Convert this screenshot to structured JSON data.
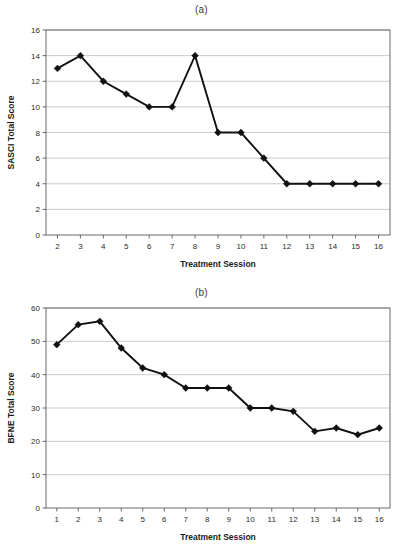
{
  "figure": {
    "panels": [
      {
        "id": "a",
        "title": "(a)",
        "xlabel": "Treatment Session",
        "ylabel": "SASCI Total Score"
      },
      {
        "id": "b",
        "title": "(b)",
        "xlabel": "Treatment Session",
        "ylabel": "BFNE Total Score"
      }
    ]
  },
  "chart_data": [
    {
      "type": "line",
      "title": "(a)",
      "xlabel": "Treatment Session",
      "ylabel": "SASCI Total Score",
      "x": [
        2,
        3,
        4,
        5,
        6,
        7,
        8,
        9,
        10,
        11,
        12,
        13,
        14,
        15,
        16
      ],
      "values": [
        13,
        14,
        12,
        11,
        10,
        10,
        14,
        8,
        8,
        6,
        4,
        4,
        4,
        4,
        4
      ],
      "xtick_labels": [
        "2",
        "3",
        "4",
        "5",
        "6",
        "7",
        "8",
        "9",
        "10",
        "11",
        "12",
        "13",
        "14",
        "15",
        "16"
      ],
      "ytick_labels": [
        "0",
        "2",
        "4",
        "6",
        "8",
        "10",
        "12",
        "14",
        "16"
      ],
      "yticks": [
        0,
        2,
        4,
        6,
        8,
        10,
        12,
        14,
        16
      ],
      "xlim": [
        1.5,
        16.5
      ],
      "ylim": [
        0,
        16
      ],
      "grid": true,
      "legend": "none",
      "marker": "diamond",
      "line_color": "#111111",
      "grid_color": "#b4b4b4"
    },
    {
      "type": "line",
      "title": "(b)",
      "xlabel": "Treatment Session",
      "ylabel": "BFNE Total Score",
      "x": [
        1,
        2,
        3,
        4,
        5,
        6,
        7,
        8,
        9,
        10,
        11,
        12,
        13,
        14,
        15,
        16
      ],
      "values": [
        49,
        55,
        56,
        48,
        42,
        40,
        36,
        36,
        36,
        30,
        30,
        29,
        23,
        24,
        22,
        24
      ],
      "xtick_labels": [
        "1",
        "2",
        "3",
        "4",
        "5",
        "6",
        "7",
        "8",
        "9",
        "10",
        "11",
        "12",
        "13",
        "14",
        "15",
        "16"
      ],
      "ytick_labels": [
        "0",
        "10",
        "20",
        "30",
        "40",
        "50",
        "60"
      ],
      "yticks": [
        0,
        10,
        20,
        30,
        40,
        50,
        60
      ],
      "xlim": [
        0.5,
        16.5
      ],
      "ylim": [
        0,
        60
      ],
      "grid": true,
      "legend": "none",
      "marker": "diamond",
      "line_color": "#111111",
      "grid_color": "#b4b4b4"
    }
  ]
}
